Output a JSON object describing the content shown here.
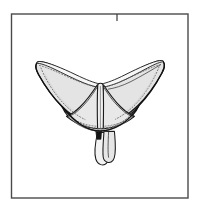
{
  "figure": {
    "title": "Brassiere technical line drawing",
    "caption": "",
    "background_color": "#ffffff",
    "frame": {
      "name": "figure-border",
      "x": 11.5,
      "y": 14.0,
      "width": 176.5,
      "height": 184.0,
      "stroke_color": "#4a4a4a",
      "stroke_width": 1.4,
      "fill": "none"
    },
    "top_tick": {
      "name": "top-edge-tick-mark",
      "x": 117.0,
      "y_start": 14.0,
      "y_end": 21.0,
      "stroke_color": "#3a3a3a",
      "stroke_width": 1.2
    },
    "palette": {
      "outline": "#1a1a1a",
      "fabric_fill": "#e2e2e2",
      "fabric_fill_light": "#ededed",
      "fabric_fill_deep": "#d6d6d6",
      "stitch_dotted": "#6f6f6f",
      "shadow": "#b8b8b8",
      "clasp_dark": "#141414",
      "frame": "#4a4a4a"
    },
    "parts": [
      {
        "id": "left-wing",
        "label": "Left wing / side panel",
        "fill": "#e4e4e4",
        "stroke": "#1a1a1a"
      },
      {
        "id": "right-wing",
        "label": "Right wing / side panel",
        "fill": "#e4e4e4",
        "stroke": "#1a1a1a"
      },
      {
        "id": "left-cup",
        "label": "Left cup panel",
        "fill": "#e8e8e8",
        "stroke": "#1a1a1a"
      },
      {
        "id": "right-cup",
        "label": "Right cup panel",
        "fill": "#e8e8e8",
        "stroke": "#1a1a1a"
      },
      {
        "id": "center-gore",
        "label": "Center gore",
        "fill": "#efefef",
        "stroke": "#1a1a1a"
      },
      {
        "id": "underband",
        "label": "Under band with stitching",
        "fill": "#ededed",
        "stroke": "#1a1a1a"
      },
      {
        "id": "hanging-strap",
        "label": "Hanging shoulder strap",
        "fill": "#e6e6e6",
        "stroke": "#1a1a1a"
      },
      {
        "id": "strap-clasp",
        "label": "Strap clasp / slider",
        "fill": "#141414",
        "stroke": "#141414"
      }
    ],
    "strap": {
      "name": "hanging-strap",
      "top_x": 108,
      "top_y": 131,
      "bottom_y": 166,
      "width": 13
    }
  }
}
